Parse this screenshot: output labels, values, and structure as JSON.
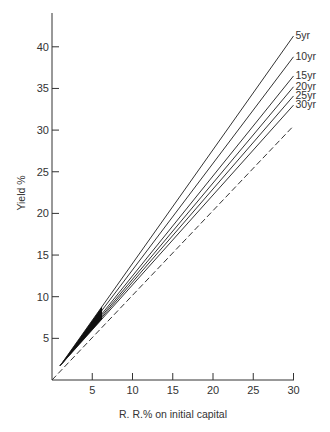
{
  "chart_data": {
    "type": "line",
    "title": "",
    "xlabel": "R. R.% on initial capital",
    "ylabel": "Yield %",
    "xlim": [
      0,
      30
    ],
    "ylim": [
      0,
      44
    ],
    "xticks": [
      5,
      10,
      15,
      20,
      25,
      30
    ],
    "yticks": [
      5,
      10,
      15,
      20,
      25,
      30,
      35,
      40
    ],
    "grid": false,
    "legend": "inline labels at line ends",
    "series": [
      {
        "name": "5yr",
        "x": [
          1,
          30
        ],
        "y": [
          1.7,
          41.3
        ],
        "style": "solid"
      },
      {
        "name": "10yr",
        "x": [
          1,
          30
        ],
        "y": [
          1.7,
          38.8
        ],
        "style": "solid"
      },
      {
        "name": "15yr",
        "x": [
          1,
          30
        ],
        "y": [
          1.7,
          36.5
        ],
        "style": "solid"
      },
      {
        "name": "20yr",
        "x": [
          1,
          30
        ],
        "y": [
          1.7,
          35.2
        ],
        "style": "solid"
      },
      {
        "name": "25yr",
        "x": [
          1,
          30
        ],
        "y": [
          1.7,
          34.1
        ],
        "style": "solid"
      },
      {
        "name": "30yr",
        "x": [
          1,
          30
        ],
        "y": [
          1.7,
          33.0
        ],
        "style": "solid"
      },
      {
        "name": "reference (yield = R.R.)",
        "x": [
          0,
          30
        ],
        "y": [
          0,
          30.5
        ],
        "style": "dashed"
      }
    ]
  },
  "layout": {
    "origin_px": [
      52,
      380
    ],
    "px_per_x": 8.05,
    "px_per_y": 8.33,
    "y_axis_top_px": 13,
    "x_axis_right_px": 294,
    "line_color": "#333333"
  }
}
